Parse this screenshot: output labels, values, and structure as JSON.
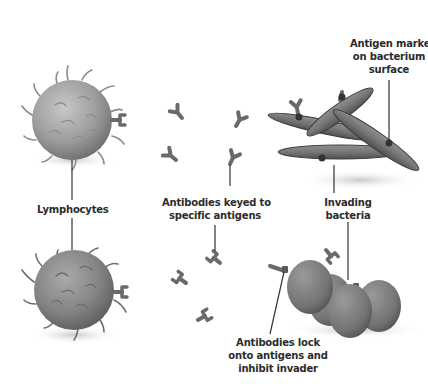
{
  "diagram": {
    "title": "",
    "labels": {
      "lymphocytes": "Lymphocytes",
      "antibodies_keyed_1": "Antibodies keyed to",
      "antibodies_keyed_2": "specific antigens",
      "antigen_marker_1": "Antigen marker",
      "antigen_marker_2": "on bacterium",
      "antigen_marker_3": "surface",
      "invading_1": "Invading",
      "invading_2": "bacteria",
      "lock_1": "Antibodies lock",
      "lock_2": "onto antigens and",
      "lock_3": "inhibit invader"
    },
    "colors": {
      "cell": "#9a9a9a",
      "bacteria": "#6e6e6e",
      "antibody": "#6a6a6a",
      "leader_line": "#333333",
      "text": "#2b2b2b"
    }
  }
}
